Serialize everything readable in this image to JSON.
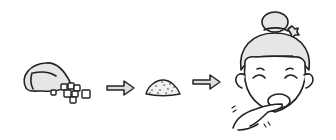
{
  "illustration": {
    "description": "Three-step sequence: bag with sugar cubes, arrow, crushed powder pile, arrow, smiling girl tasting from finger",
    "steps": [
      {
        "name": "bag-with-cubes",
        "icon": "sugar-bag-icon"
      },
      {
        "name": "arrow-1",
        "icon": "arrow-right-icon"
      },
      {
        "name": "powder-pile",
        "icon": "powder-pile-icon"
      },
      {
        "name": "arrow-2",
        "icon": "arrow-right-icon"
      },
      {
        "name": "girl-tasting",
        "icon": "girl-tasting-icon"
      }
    ],
    "colors": {
      "stroke": "#222222",
      "fill_light": "#e6e6e6",
      "background": "#ffffff"
    }
  }
}
